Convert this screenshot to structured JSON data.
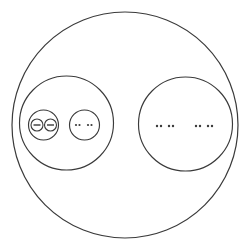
{
  "figure": {
    "background_color": "#ffffff",
    "stroke_color": "#3a3a3a",
    "width": 247,
    "height": 252
  },
  "shapes": {
    "outer_circle": {
      "name": "outer-circle",
      "cx": 125,
      "cy": 125,
      "r": 113,
      "stroke_width": 1.2
    },
    "left_group_circle": {
      "name": "left-group-circle",
      "cx": 66.5,
      "cy": 123,
      "r": 47,
      "stroke_width": 1.15
    },
    "right_group_circle": {
      "name": "right-group-circle",
      "cx": 185.5,
      "cy": 124,
      "r": 47,
      "stroke_width": 1.15
    },
    "left_inner_circle_a": {
      "name": "left-inner-circle-a",
      "cx": 43.5,
      "cy": 125,
      "r": 15,
      "stroke_width": 1.15
    },
    "left_inner_circle_b": {
      "name": "left-inner-circle-b",
      "cx": 84.5,
      "cy": 125,
      "r": 15,
      "stroke_width": 1.15
    },
    "tiny_circle_a": {
      "name": "tiny-circle-a",
      "cx": 37,
      "cy": 125,
      "r": 6,
      "stroke_width": 1.1
    },
    "tiny_circle_b": {
      "name": "tiny-circle-b",
      "cx": 50.5,
      "cy": 125,
      "r": 6,
      "stroke_width": 1.1
    }
  },
  "marks": {
    "tiny_bar_a": {
      "name": "tiny-bar-a",
      "x1": 33.5,
      "x2": 40.5,
      "y": 125
    },
    "tiny_bar_b": {
      "name": "tiny-bar-b",
      "x1": 47,
      "x2": 54,
      "y": 125
    },
    "ellipsis_inner_left": {
      "name": "ellipsis-inner-left",
      "dots": [
        {
          "cx": 76,
          "cy": 125,
          "r": 1.1
        },
        {
          "cx": 79.5,
          "cy": 125,
          "r": 1.1
        },
        {
          "cx": 88,
          "cy": 125,
          "r": 1.1
        },
        {
          "cx": 91.5,
          "cy": 125,
          "r": 1.1
        }
      ]
    },
    "ellipsis_right_group_first": {
      "name": "ellipsis-right-group-first",
      "dots": [
        {
          "cx": 157,
          "cy": 126,
          "r": 1.2
        },
        {
          "cx": 161,
          "cy": 126,
          "r": 1.2
        },
        {
          "cx": 169,
          "cy": 126,
          "r": 1.2
        },
        {
          "cx": 173,
          "cy": 126,
          "r": 1.2
        }
      ]
    },
    "ellipsis_right_group_second": {
      "name": "ellipsis-right-group-second",
      "dots": [
        {
          "cx": 196,
          "cy": 126,
          "r": 1.2
        },
        {
          "cx": 200,
          "cy": 126,
          "r": 1.2
        },
        {
          "cx": 208,
          "cy": 126,
          "r": 1.2
        },
        {
          "cx": 212,
          "cy": 126,
          "r": 1.2
        }
      ]
    }
  }
}
